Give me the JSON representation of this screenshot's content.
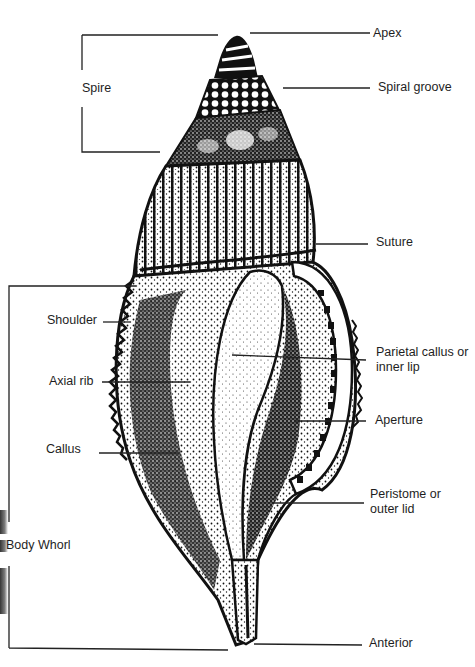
{
  "diagram": {
    "labels": {
      "apex": "Apex",
      "spire": "Spire",
      "spiral_groove": "Spiral groove",
      "suture": "Suture",
      "shoulder": "Shoulder",
      "axial_rib": "Axial rib",
      "parietal_callus": "Parietal callus or inner lip",
      "aperture": "Aperture",
      "callus": "Callus",
      "peristome": "Peristome or outer lid",
      "body_whorl": "Body Whorl",
      "anterior": "Anterior"
    },
    "colors": {
      "ink": "#111111",
      "background": "#ffffff",
      "label_text": "#1e1e1e"
    }
  }
}
